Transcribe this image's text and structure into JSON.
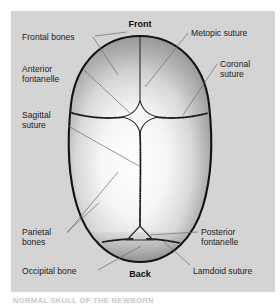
{
  "figure": {
    "title_orientation_top": "Front",
    "title_orientation_bottom": "Back",
    "caption": "NORMAL SKULL OF THE NEWBORN",
    "panel_color": "#d4d4d4",
    "outline_color": "#14140f",
    "leader_color": "#6d6d73",
    "labels": {
      "frontal_bones": "Frontal bones",
      "anterior_fontanelle_line1": "Anterior",
      "anterior_fontanelle_line2": "fontanelle",
      "sagittal_suture_line1": "Sagittal",
      "sagittal_suture_line2": "suture",
      "parietal_bones_line1": "Parietal",
      "parietal_bones_line2": "bones",
      "occipital_bone": "Occipital bone",
      "metopic_suture": "Metopic suture",
      "coronal_suture_line1": "Coronal",
      "coronal_suture_line2": "suture",
      "posterior_fontanelle_line1": "Posterior",
      "posterior_fontanelle_line2": "fontanelle",
      "lamdoid_suture": "Lamdoid suture"
    }
  }
}
